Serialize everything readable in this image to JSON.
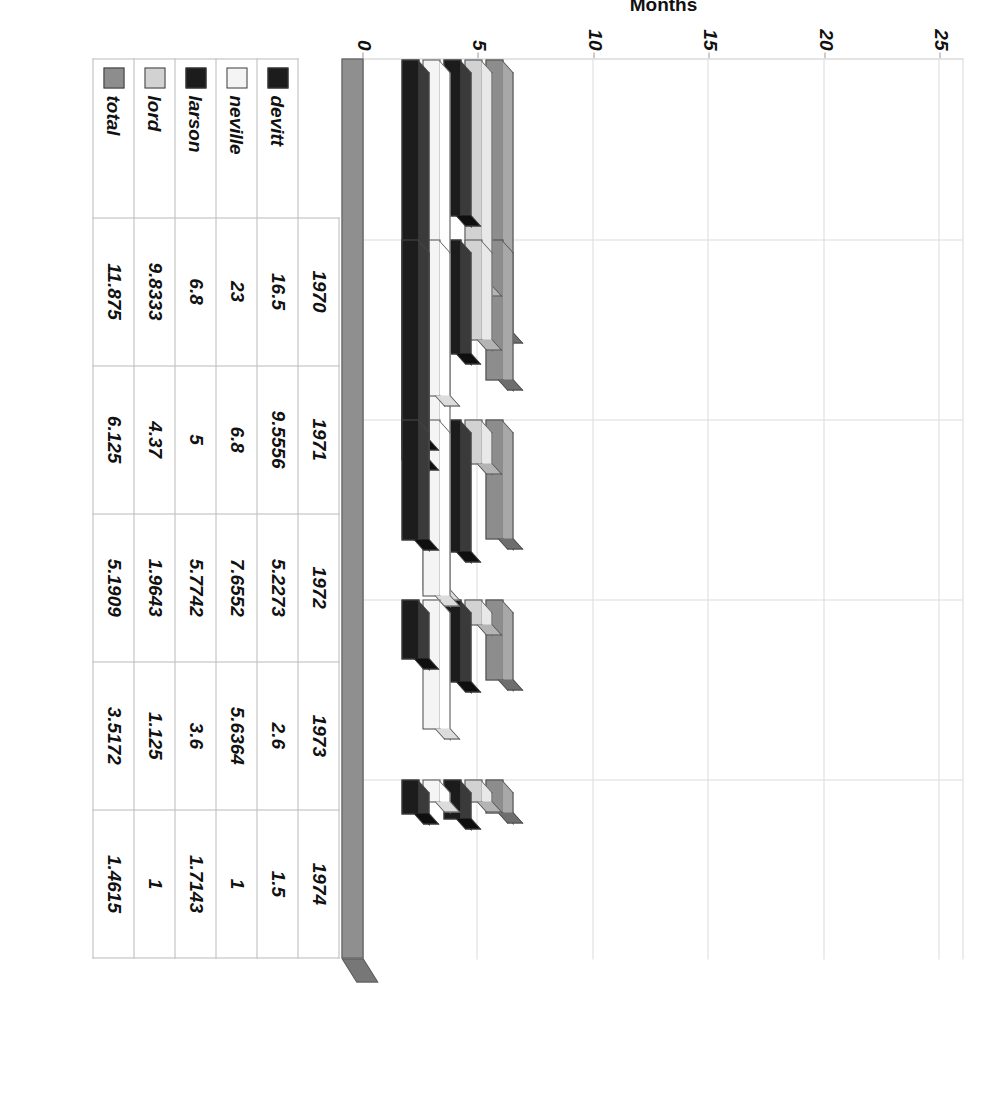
{
  "chart_data": {
    "type": "bar",
    "title": "",
    "subtitle": "",
    "xlabel": "",
    "ylabel": "Months",
    "categories": [
      "1970",
      "1971",
      "1972",
      "1973",
      "1974"
    ],
    "series": [
      {
        "name": "devitt",
        "color": "#1c1c1c",
        "values": [
          16.5,
          9.5556,
          5.2273,
          2.6,
          1.5
        ]
      },
      {
        "name": "neville",
        "color": "#f4f4f4",
        "values": [
          23,
          6.8,
          7.6552,
          5.6364,
          1
        ]
      },
      {
        "name": "larson",
        "color": "#1c1c1c",
        "values": [
          6.8,
          5,
          5.7742,
          3.6,
          1.7143
        ]
      },
      {
        "name": "lord",
        "color": "#d2d2d2",
        "values": [
          9.8333,
          4.37,
          1.9643,
          1.125,
          1
        ]
      },
      {
        "name": "total",
        "color": "#8d8d8d",
        "values": [
          11.875,
          6.125,
          5.1909,
          3.5172,
          1.4615
        ]
      }
    ],
    "value_ticks": [
      0,
      5,
      10,
      15,
      20,
      25
    ],
    "value_tick_labels": [
      "0",
      "5",
      "10",
      "15",
      "20",
      "25"
    ],
    "ylim": [
      0,
      26
    ],
    "grid": true,
    "grid_axis": "value",
    "legend_position": "table-row-headers",
    "orientation": "horizontal-3d",
    "rotated_degrees": 90,
    "has_data_table": true
  },
  "table": {
    "year_header": [
      "1970",
      "1971",
      "1972",
      "1973",
      "1974"
    ],
    "rows": [
      {
        "label": "devitt",
        "swatch": "sw-devitt",
        "cells": [
          "16.5",
          "9.5556",
          "5.2273",
          "2.6",
          "1.5"
        ]
      },
      {
        "label": "neville",
        "swatch": "sw-neville",
        "cells": [
          "23",
          "6.8",
          "7.6552",
          "5.6364",
          "1"
        ]
      },
      {
        "label": "larson",
        "swatch": "sw-larson",
        "cells": [
          "6.8",
          "5",
          "5.7742",
          "3.6",
          "1.7143"
        ]
      },
      {
        "label": "lord",
        "swatch": "sw-lord",
        "cells": [
          "9.8333",
          "4.37",
          "1.9643",
          "1.125",
          "1"
        ]
      },
      {
        "label": "total",
        "swatch": "sw-total",
        "cells": [
          "11.875",
          "6.125",
          "5.1909",
          "3.5172",
          "1.4615"
        ]
      }
    ]
  },
  "axis": {
    "value_title": "Months",
    "tick_labels": [
      "0",
      "5",
      "10",
      "15",
      "20",
      "25"
    ]
  },
  "colors": {
    "devitt": "#1c1c1c",
    "neville": "#f4f4f4",
    "larson": "#1c1c1c",
    "lord": "#d2d2d2",
    "total": "#8d8d8d",
    "backwall": "#8f8f8f",
    "grid": "#dcdcdc",
    "text": "#111111"
  }
}
